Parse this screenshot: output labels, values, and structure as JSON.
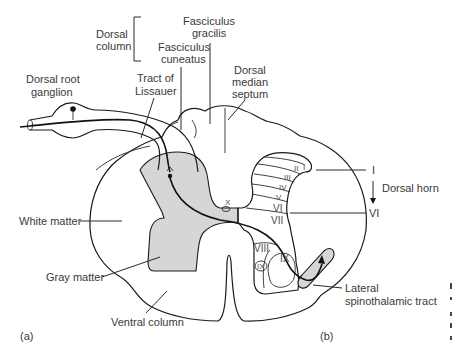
{
  "figure": {
    "panel_labels": {
      "a": "(a)",
      "b": "(b)"
    },
    "labels": {
      "dorsal_column_line1": "Dorsal",
      "dorsal_column_line2": "column",
      "fasciculus_gracilis_line1": "Fasciculus",
      "fasciculus_gracilis_line2": "gracilis",
      "fasciculus_cuneatus_line1": "Fasciculus",
      "fasciculus_cuneatus_line2": "cuneatus",
      "dorsal_root_ganglion_line1": "Dorsal root",
      "dorsal_root_ganglion_line2": "ganglion",
      "tract_of_lissauer_line1": "Tract of",
      "tract_of_lissauer_line2": "Lissauer",
      "dorsal_median_septum_line1": "Dorsal",
      "dorsal_median_septum_line2": "median",
      "dorsal_median_septum_line3": "septum",
      "white_matter": "White matter",
      "gray_matter": "Gray matter",
      "ventral_column": "Ventral column",
      "lateral_spinothalamic_line1": "Lateral",
      "lateral_spinothalamic_line2": "spinothalamic tract",
      "dorsal_horn": "Dorsal horn",
      "lamina_range_top": "I",
      "lamina_range_bottom": "VI"
    },
    "laminae": [
      "I",
      "II",
      "III",
      "IV",
      "V",
      "VI",
      "VII",
      "VIII",
      "IX",
      "X"
    ],
    "colors": {
      "gray_matter_fill": "#d6d6d6",
      "outline": "#1a1a1a",
      "text": "#3a3a3a"
    }
  }
}
